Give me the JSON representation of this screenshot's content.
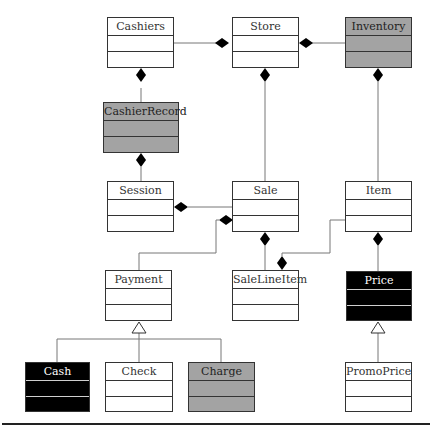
{
  "diagram": {
    "type": "UML class diagram",
    "classes": [
      {
        "id": "cashiers",
        "name": "Cashiers",
        "fill": "white",
        "x": 107,
        "y": 17,
        "w": 67,
        "h": 51
      },
      {
        "id": "store",
        "name": "Store",
        "fill": "white",
        "x": 232,
        "y": 17,
        "w": 67,
        "h": 51
      },
      {
        "id": "inventory",
        "name": "Inventory",
        "fill": "gray",
        "x": 345,
        "y": 17,
        "w": 67,
        "h": 51
      },
      {
        "id": "cashierrecord",
        "name": "CashierRecord",
        "fill": "gray",
        "x": 103,
        "y": 102,
        "w": 76,
        "h": 51
      },
      {
        "id": "session",
        "name": "Session",
        "fill": "white",
        "x": 107,
        "y": 181,
        "w": 67,
        "h": 51
      },
      {
        "id": "sale",
        "name": "Sale",
        "fill": "white",
        "x": 232,
        "y": 181,
        "w": 67,
        "h": 51
      },
      {
        "id": "item",
        "name": "Item",
        "fill": "white",
        "x": 345,
        "y": 181,
        "w": 67,
        "h": 51
      },
      {
        "id": "payment",
        "name": "Payment",
        "fill": "white",
        "x": 105,
        "y": 270,
        "w": 67,
        "h": 51
      },
      {
        "id": "salelineitem",
        "name": "SaleLineItem",
        "fill": "white",
        "x": 232,
        "y": 270,
        "w": 67,
        "h": 51
      },
      {
        "id": "price",
        "name": "Price",
        "fill": "black",
        "x": 346,
        "y": 271,
        "w": 66,
        "h": 50
      },
      {
        "id": "cash",
        "name": "Cash",
        "fill": "black",
        "x": 25,
        "y": 362,
        "w": 65,
        "h": 50
      },
      {
        "id": "check",
        "name": "Check",
        "fill": "white",
        "x": 105,
        "y": 362,
        "w": 68,
        "h": 50
      },
      {
        "id": "charge",
        "name": "Charge",
        "fill": "gray",
        "x": 188,
        "y": 362,
        "w": 67,
        "h": 50
      },
      {
        "id": "promoprice",
        "name": "PromoPrice",
        "fill": "white",
        "x": 345,
        "y": 362,
        "w": 67,
        "h": 50
      }
    ],
    "relationships": [
      {
        "type": "composition",
        "whole": "Store",
        "part": "Cashiers"
      },
      {
        "type": "composition",
        "whole": "Store",
        "part": "Inventory"
      },
      {
        "type": "composition",
        "whole": "Cashiers",
        "part": "CashierRecord"
      },
      {
        "type": "composition",
        "whole": "CashierRecord",
        "part": "Session"
      },
      {
        "type": "composition",
        "whole": "Store",
        "part": "Sale"
      },
      {
        "type": "composition",
        "whole": "Inventory",
        "part": "Item"
      },
      {
        "type": "composition",
        "whole": "Session",
        "part": "Sale"
      },
      {
        "type": "composition",
        "whole": "Sale",
        "part": "Payment"
      },
      {
        "type": "composition",
        "whole": "Sale",
        "part": "SaleLineItem"
      },
      {
        "type": "composition",
        "whole": "SaleLineItem",
        "part": "Item"
      },
      {
        "type": "composition",
        "whole": "Item",
        "part": "Price"
      },
      {
        "type": "generalization",
        "parent": "Payment",
        "child": "Cash"
      },
      {
        "type": "generalization",
        "parent": "Payment",
        "child": "Check"
      },
      {
        "type": "generalization",
        "parent": "Payment",
        "child": "Charge"
      },
      {
        "type": "generalization",
        "parent": "Price",
        "child": "PromoPrice"
      }
    ],
    "colors": {
      "white": "#ffffff",
      "gray": "#a3a3a3",
      "black": "#000000",
      "line": "#666666",
      "border": "#333333"
    }
  }
}
